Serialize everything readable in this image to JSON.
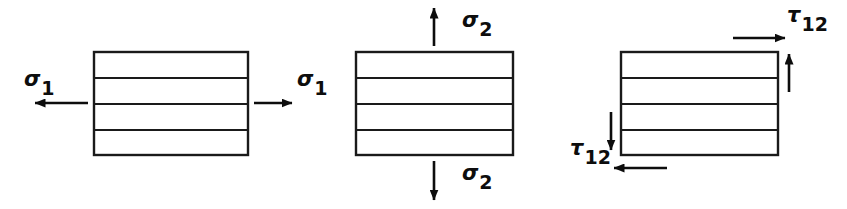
{
  "figure": {
    "background_color": "#ffffff",
    "line_color": "#1a1a1a",
    "arrow_color": "#0d0d0d",
    "width": 847,
    "height": 209,
    "ply_count": 4
  },
  "elements": [
    {
      "id": "longitudinal-tension",
      "description": "Laminate element loaded in longitudinal tension",
      "rect": {
        "x": 94,
        "y": 52,
        "width": 154,
        "height": 103
      },
      "ply_dividers_y": [
        78,
        104,
        130
      ],
      "labels": [
        {
          "name": "sigma-1-left",
          "symbol": "σ",
          "subscript": "1",
          "text": "σ1",
          "x": 24,
          "y": 86,
          "anchor": "start"
        },
        {
          "name": "sigma-1-right",
          "symbol": "σ",
          "subscript": "1",
          "text": "σ1",
          "x": 297,
          "y": 86,
          "anchor": "start"
        }
      ],
      "arrows": [
        {
          "name": "arrow-left",
          "direction": "left",
          "x1": 88,
          "y1": 103,
          "x2": 35,
          "y2": 103
        },
        {
          "name": "arrow-right",
          "direction": "right",
          "x1": 254,
          "y1": 103,
          "x2": 292,
          "y2": 103
        }
      ]
    },
    {
      "id": "transverse-tension",
      "description": "Laminate element loaded in transverse tension",
      "rect": {
        "x": 356,
        "y": 52,
        "width": 157,
        "height": 103
      },
      "ply_dividers_y": [
        78,
        104,
        130
      ],
      "labels": [
        {
          "name": "sigma-2-top",
          "symbol": "σ",
          "subscript": "2",
          "text": "σ2",
          "x": 462,
          "y": 27,
          "anchor": "start"
        },
        {
          "name": "sigma-2-bottom",
          "symbol": "σ",
          "subscript": "2",
          "text": "σ2",
          "x": 462,
          "y": 180,
          "anchor": "start"
        }
      ],
      "arrows": [
        {
          "name": "arrow-up",
          "direction": "up",
          "x1": 434,
          "y1": 46,
          "x2": 434,
          "y2": 8
        },
        {
          "name": "arrow-down",
          "direction": "down",
          "x1": 434,
          "y1": 161,
          "x2": 434,
          "y2": 200
        }
      ]
    },
    {
      "id": "in-plane-shear",
      "description": "Laminate element loaded in in-plane shear",
      "rect": {
        "x": 621,
        "y": 52,
        "width": 157,
        "height": 103
      },
      "ply_dividers_y": [
        78,
        104,
        130
      ],
      "labels": [
        {
          "name": "tau-12-top-right",
          "symbol": "τ",
          "subscript": "12",
          "text": "τ12",
          "x": 787,
          "y": 22,
          "anchor": "start"
        },
        {
          "name": "tau-12-bottom-left",
          "symbol": "τ",
          "subscript": "12",
          "text": "τ12",
          "x": 570,
          "y": 155,
          "anchor": "start"
        }
      ],
      "arrows": [
        {
          "name": "arrow-top-right",
          "direction": "right",
          "x1": 733,
          "y1": 38,
          "x2": 785,
          "y2": 38
        },
        {
          "name": "arrow-right-up",
          "direction": "up",
          "x1": 789,
          "y1": 92,
          "x2": 789,
          "y2": 52
        },
        {
          "name": "arrow-bottom-left",
          "direction": "left",
          "x1": 667,
          "y1": 168,
          "x2": 614,
          "y2": 168
        },
        {
          "name": "arrow-left-down",
          "direction": "down",
          "x1": 611,
          "y1": 112,
          "x2": 611,
          "y2": 152
        }
      ]
    }
  ]
}
